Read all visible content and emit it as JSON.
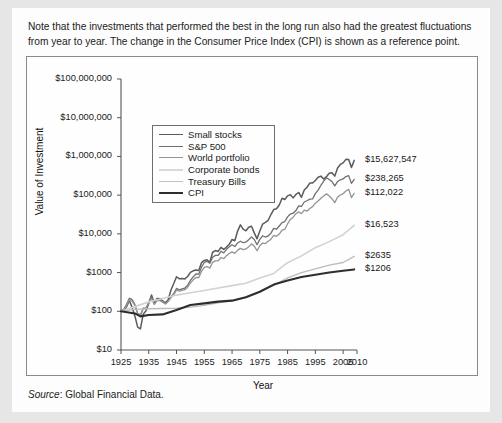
{
  "note": "Note that the investments that performed the best in the long run also had the greatest fluctuations from year to year. The change in the Consumer Price Index (CPI) is shown as a reference point.",
  "source": {
    "label": "Source",
    "separator": ": ",
    "text": "Global Financial Data."
  },
  "chart_data": {
    "type": "line",
    "title": "",
    "xlabel": "Year",
    "ylabel": "Value of Investment",
    "yscale": "log",
    "ylim": [
      10,
      100000000
    ],
    "xlim": [
      1925,
      2010
    ],
    "grid": false,
    "legend_position": "top-left-inside",
    "ytick_labels": [
      "$100,000,000",
      "$10,000,000",
      "$1,000,000",
      "$100,000",
      "$10,000",
      "$1000",
      "$100",
      "$10"
    ],
    "ytick_values": [
      100000000,
      10000000,
      1000000,
      100000,
      10000,
      1000,
      100,
      10
    ],
    "xtick_labels": [
      "1925",
      "1935",
      "1945",
      "1955",
      "1965",
      "1975",
      "1985",
      "1995",
      "2005",
      "2010"
    ],
    "xtick_values": [
      1925,
      1935,
      1945,
      1955,
      1965,
      1975,
      1985,
      1995,
      2005,
      2010
    ],
    "end_labels": [
      "$15,627,547",
      "$238,265",
      "$112,022",
      "$16,523",
      "$2635",
      "$1206"
    ],
    "series": [
      {
        "name": "Small stocks",
        "color": "#5b5b5b",
        "width": 1.5,
        "end_label": "$15,627,547",
        "x": [
          1925,
          1926,
          1927,
          1928,
          1929,
          1930,
          1931,
          1932,
          1933,
          1934,
          1935,
          1936,
          1937,
          1938,
          1939,
          1940,
          1941,
          1942,
          1943,
          1944,
          1945,
          1946,
          1947,
          1948,
          1949,
          1950,
          1951,
          1952,
          1953,
          1954,
          1955,
          1956,
          1957,
          1958,
          1959,
          1960,
          1961,
          1962,
          1963,
          1964,
          1965,
          1966,
          1967,
          1968,
          1969,
          1970,
          1971,
          1972,
          1973,
          1974,
          1975,
          1976,
          1977,
          1978,
          1979,
          1980,
          1981,
          1982,
          1983,
          1984,
          1985,
          1986,
          1987,
          1988,
          1989,
          1990,
          1991,
          1992,
          1993,
          1994,
          1995,
          1996,
          1997,
          1998,
          1999,
          2000,
          2001,
          2002,
          2003,
          2004,
          2005,
          2006,
          2007,
          2008,
          2009
        ],
        "y": [
          100,
          107,
          130,
          190,
          126,
          76,
          39,
          35,
          84,
          103,
          160,
          265,
          160,
          215,
          210,
          185,
          166,
          200,
          356,
          520,
          780,
          690,
          700,
          685,
          790,
          1010,
          1110,
          1170,
          1130,
          1800,
          2060,
          2150,
          1850,
          3350,
          3700,
          3520,
          4480,
          3950,
          4580,
          5380,
          7150,
          6650,
          11800,
          17100,
          13300,
          12000,
          14800,
          15700,
          10600,
          7450,
          11800,
          17900,
          19800,
          22400,
          31600,
          42400,
          44600,
          55800,
          83000,
          77000,
          96000,
          103000,
          85000,
          104000,
          117000,
          88000,
          135000,
          160000,
          205000,
          205000,
          240000,
          290000,
          310000,
          260000,
          300000,
          370000,
          380000,
          310000,
          505000,
          620000,
          680000,
          840000,
          830000,
          520000,
          790000
        ],
        "label_end": true
      },
      {
        "name": "S&P 500",
        "color": "#6f6f6f",
        "width": 1.3,
        "end_label": "$238,265",
        "x": [
          1925,
          1926,
          1927,
          1928,
          1929,
          1930,
          1931,
          1932,
          1933,
          1934,
          1935,
          1936,
          1937,
          1938,
          1939,
          1940,
          1941,
          1942,
          1943,
          1944,
          1945,
          1946,
          1947,
          1948,
          1949,
          1950,
          1951,
          1952,
          1953,
          1954,
          1955,
          1956,
          1957,
          1958,
          1959,
          1960,
          1961,
          1962,
          1963,
          1964,
          1965,
          1966,
          1967,
          1968,
          1969,
          1970,
          1971,
          1972,
          1973,
          1974,
          1975,
          1976,
          1977,
          1978,
          1979,
          1980,
          1981,
          1982,
          1983,
          1984,
          1985,
          1986,
          1987,
          1988,
          1989,
          1990,
          1991,
          1992,
          1993,
          1994,
          1995,
          1996,
          1997,
          1998,
          1999,
          2000,
          2001,
          2002,
          2003,
          2004,
          2005,
          2006,
          2007,
          2008,
          2009
        ],
        "y": [
          100,
          112,
          152,
          218,
          200,
          150,
          85,
          78,
          120,
          118,
          175,
          234,
          152,
          199,
          198,
          178,
          157,
          189,
          238,
          285,
          389,
          358,
          378,
          399,
          475,
          625,
          776,
          918,
          908,
          1385,
          1822,
          1941,
          1734,
          2487,
          2785,
          2799,
          3550,
          3240,
          3980,
          4640,
          5220,
          4696,
          5820,
          6460,
          5910,
          6150,
          7030,
          8360,
          7140,
          5250,
          7200,
          8920,
          8280,
          8820,
          10450,
          13840,
          13160,
          15990,
          19590,
          20820,
          27420,
          32530,
          34240,
          39930,
          52570,
          50940,
          66440,
          71510,
          78700,
          79740,
          109700,
          134900,
          179900,
          231300,
          279900,
          254400,
          224100,
          174600,
          224700,
          249200,
          261400,
          302700,
          319300,
          201200,
          254600
        ],
        "label_end": true
      },
      {
        "name": "World portfolio",
        "color": "#949494",
        "width": 1.3,
        "end_label": "$112,022",
        "x": [
          1925,
          1926,
          1927,
          1928,
          1929,
          1930,
          1931,
          1932,
          1933,
          1934,
          1935,
          1936,
          1937,
          1938,
          1939,
          1940,
          1941,
          1942,
          1943,
          1944,
          1945,
          1946,
          1947,
          1948,
          1949,
          1950,
          1951,
          1952,
          1953,
          1954,
          1955,
          1956,
          1957,
          1958,
          1959,
          1960,
          1961,
          1962,
          1963,
          1964,
          1965,
          1966,
          1967,
          1968,
          1969,
          1970,
          1971,
          1972,
          1973,
          1974,
          1975,
          1976,
          1977,
          1978,
          1979,
          1980,
          1981,
          1982,
          1983,
          1984,
          1985,
          1986,
          1987,
          1988,
          1989,
          1990,
          1991,
          1992,
          1993,
          1994,
          1995,
          1996,
          1997,
          1998,
          1999,
          2000,
          2001,
          2002,
          2003,
          2004,
          2005,
          2006,
          2007,
          2008,
          2009
        ],
        "y": [
          100,
          110,
          142,
          196,
          182,
          139,
          88,
          82,
          118,
          120,
          168,
          215,
          150,
          188,
          188,
          172,
          155,
          180,
          225,
          268,
          350,
          330,
          345,
          362,
          420,
          535,
          650,
          745,
          740,
          1080,
          1360,
          1430,
          1300,
          1840,
          2010,
          2010,
          2450,
          2280,
          2740,
          3120,
          3430,
          3140,
          3800,
          4210,
          3920,
          4080,
          4650,
          5520,
          4810,
          3660,
          4920,
          5800,
          5620,
          6420,
          7280,
          9150,
          8620,
          9850,
          12450,
          13100,
          18200,
          23600,
          27000,
          33200,
          37000,
          33200,
          40900,
          38600,
          45000,
          50600,
          62000,
          70500,
          83300,
          95000,
          108000,
          95000,
          80500,
          64000,
          88500,
          101000,
          109000,
          128000,
          142000,
          86000,
          112022
        ],
        "label_end": true
      },
      {
        "name": "Corporate bonds",
        "color": "#d2d2d2",
        "width": 1.6,
        "end_label": "$16,523",
        "x": [
          1925,
          1930,
          1935,
          1940,
          1945,
          1950,
          1955,
          1960,
          1965,
          1970,
          1975,
          1980,
          1985,
          1990,
          1995,
          2000,
          2005,
          2009
        ],
        "y": [
          100,
          132,
          175,
          215,
          262,
          300,
          345,
          400,
          460,
          530,
          720,
          950,
          1800,
          2700,
          4400,
          6300,
          9500,
          16523
        ],
        "label_end": true
      },
      {
        "name": "Treasury Bills",
        "color": "#bcbcbc",
        "width": 1.4,
        "end_label": "$2635",
        "x": [
          1925,
          1930,
          1935,
          1940,
          1945,
          1950,
          1955,
          1960,
          1965,
          1970,
          1975,
          1980,
          1985,
          1990,
          1995,
          2000,
          2005,
          2009
        ],
        "y": [
          100,
          112,
          116,
          118,
          120,
          128,
          142,
          165,
          190,
          235,
          320,
          470,
          730,
          1000,
          1250,
          1560,
          1820,
          2635
        ],
        "label_end": true
      },
      {
        "name": "CPI",
        "color": "#2e2e2e",
        "width": 2.1,
        "end_label": "$1206",
        "x": [
          1925,
          1930,
          1932,
          1935,
          1940,
          1945,
          1950,
          1955,
          1960,
          1965,
          1970,
          1975,
          1980,
          1985,
          1990,
          1995,
          2000,
          2005,
          2009
        ],
        "y": [
          100,
          88,
          74,
          80,
          83,
          108,
          146,
          160,
          178,
          188,
          230,
          320,
          490,
          620,
          770,
          880,
          1000,
          1120,
          1206
        ],
        "label_end": true
      }
    ]
  },
  "legend": {
    "items": [
      {
        "label": "Small stocks",
        "color": "#5b5b5b",
        "width": 1.9
      },
      {
        "label": "S&P 500",
        "color": "#6f6f6f",
        "width": 1.7
      },
      {
        "label": "World portfolio",
        "color": "#949494",
        "width": 1.7
      },
      {
        "label": "Corporate bonds",
        "color": "#d8d8d8",
        "width": 2.0
      },
      {
        "label": "Treasury Bills",
        "color": "#c2c2c2",
        "width": 1.8
      },
      {
        "label": "CPI",
        "color": "#2e2e2e",
        "width": 2.4
      }
    ]
  }
}
